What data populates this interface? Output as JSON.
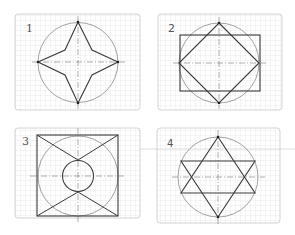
{
  "colors": {
    "grid": "#d4d4d4",
    "panel_border": "#c8c8c8",
    "circle": "#8a8a8a",
    "shape": "#3a3a3a",
    "axis": "#777777"
  },
  "panels": [
    {
      "label": "1",
      "description": "Four-pointed star inscribed in a circle with dashed center lines"
    },
    {
      "label": "2",
      "description": "Rectangle and a diamond (rotated square) inscribed in a circle"
    },
    {
      "label": "3",
      "description": "Square with circumscribed-style circle, inner small circle and diagonal X lines"
    },
    {
      "label": "4",
      "description": "Six-pointed star (two overlapping triangles) inscribed in a circle"
    }
  ]
}
